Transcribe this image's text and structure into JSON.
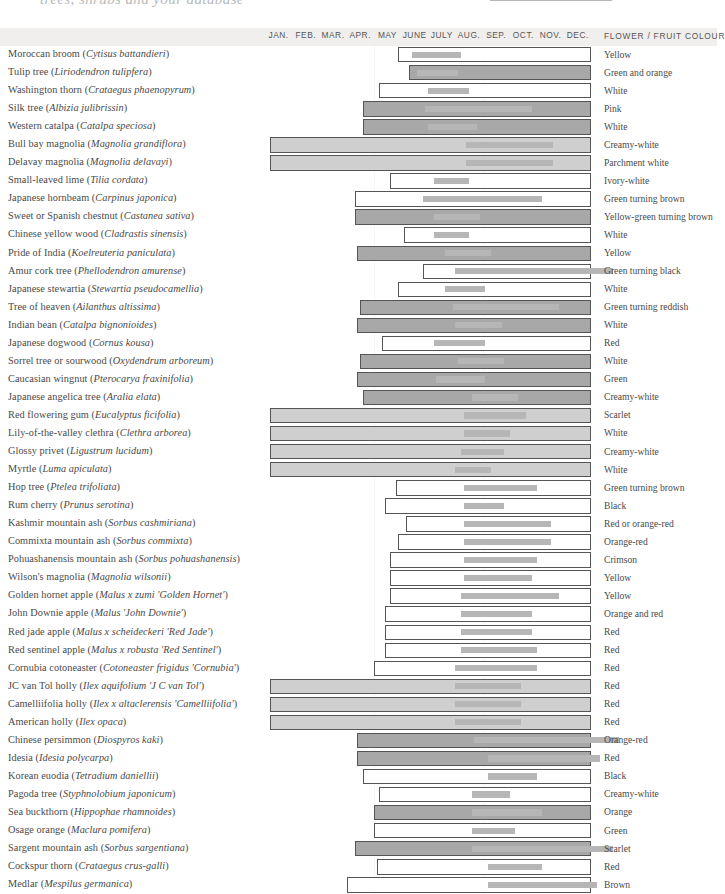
{
  "page": {
    "top_caption": "trees, shrubs and your database",
    "column_header_colour": "FLOWER / FRUIT COLOUR"
  },
  "legend": {
    "swatch_name": "flowering-time-swatch",
    "label": "FLOWERING TIME"
  },
  "chart_data": {
    "type": "bar",
    "xlabel": "",
    "ylabel": "",
    "grid": false,
    "legend_position": "top-right",
    "months": [
      "JAN.",
      "FEB.",
      "MAR.",
      "APR.",
      "MAY",
      "JUNE",
      "JULY",
      "AUG.",
      "SEP.",
      "OCT.",
      "NOV.",
      "DEC."
    ],
    "x_axis_note": "Each row spans a 12-month calendar; outlined bar = fruiting / persistence period, solid grey inner bar = flowering time.",
    "series_names": [
      "fruiting period",
      "flowering time"
    ],
    "rows": [
      {
        "common": "Moroccan broom",
        "latin": "Cytisus battandieri",
        "colour": "Yellow",
        "fruit": {
          "start": 4.9,
          "end": 12.0,
          "style": "outline"
        },
        "flower": {
          "start": 5.4,
          "end": 7.2
        }
      },
      {
        "common": "Tulip tree",
        "latin": "Liriodendron tulipfera",
        "colour": "Green and orange",
        "fruit": {
          "start": 5.3,
          "end": 12.0,
          "style": "mid"
        },
        "flower": {
          "start": 5.6,
          "end": 7.1
        }
      },
      {
        "common": "Washington thorn",
        "latin": "Crataegus phaenopyrum",
        "colour": "White",
        "fruit": {
          "start": 4.2,
          "end": 12.0,
          "style": "outline"
        },
        "flower": {
          "start": 6.0,
          "end": 7.5
        }
      },
      {
        "common": "Silk tree",
        "latin": "Albizia julibrissin",
        "colour": "Pink",
        "fruit": {
          "start": 3.6,
          "end": 12.0,
          "style": "mid"
        },
        "flower": {
          "start": 5.9,
          "end": 9.8
        }
      },
      {
        "common": "Western catalpa",
        "latin": "Catalpa speciosa",
        "colour": "White",
        "fruit": {
          "start": 3.6,
          "end": 12.0,
          "style": "mid"
        },
        "flower": {
          "start": 6.0,
          "end": 7.8
        }
      },
      {
        "common": "Bull bay magnolia",
        "latin": "Magnolia grandiflora",
        "colour": "Creamy-white",
        "fruit": {
          "start": 0.2,
          "end": 12.0,
          "style": "filled"
        },
        "flower": {
          "start": 7.4,
          "end": 10.6
        }
      },
      {
        "common": "Delavay magnolia",
        "latin": "Magnolia delavayi",
        "colour": "Parchment white",
        "fruit": {
          "start": 0.2,
          "end": 12.0,
          "style": "filled"
        },
        "flower": {
          "start": 7.4,
          "end": 10.6
        }
      },
      {
        "common": "Small-leaved lime",
        "latin": "Tilia cordata",
        "colour": "Ivory-white",
        "fruit": {
          "start": 4.6,
          "end": 12.0,
          "style": "outline"
        },
        "flower": {
          "start": 6.2,
          "end": 7.5
        }
      },
      {
        "common": "Japanese hornbeam",
        "latin": "Carpinus japonica",
        "colour": "Green turning brown",
        "fruit": {
          "start": 3.3,
          "end": 12.0,
          "style": "outline"
        },
        "flower": {
          "start": 5.8,
          "end": 10.2
        }
      },
      {
        "common": "Sweet or Spanish chestnut",
        "latin": "Castanea sativa",
        "colour": "Yellow-green turning brown",
        "fruit": {
          "start": 3.3,
          "end": 12.0,
          "style": "mid"
        },
        "flower": {
          "start": 6.2,
          "end": 7.9
        }
      },
      {
        "common": "Chinese yellow wood",
        "latin": "Cladrastis sinensis",
        "colour": "White",
        "fruit": {
          "start": 5.1,
          "end": 12.0,
          "style": "outline"
        },
        "flower": {
          "start": 6.2,
          "end": 7.5
        }
      },
      {
        "common": "Pride of India",
        "latin": "Koelreuteria paniculata",
        "colour": "Yellow",
        "fruit": {
          "start": 3.4,
          "end": 12.0,
          "style": "mid"
        },
        "flower": {
          "start": 6.6,
          "end": 8.3
        }
      },
      {
        "common": "Amur cork tree",
        "latin": "Phellodendron amurense",
        "colour": "Green turning black",
        "fruit": {
          "start": 5.8,
          "end": 12.0,
          "style": "outline"
        },
        "flower": {
          "start": 7.0,
          "end": 12.8
        }
      },
      {
        "common": "Japanese stewartia",
        "latin": "Stewartia pseudocamellia",
        "colour": "White",
        "fruit": {
          "start": 4.9,
          "end": 12.0,
          "style": "outline"
        },
        "flower": {
          "start": 6.6,
          "end": 8.1
        }
      },
      {
        "common": "Tree of heaven",
        "latin": "Ailanthus altissima",
        "colour": "Green turning reddish",
        "fruit": {
          "start": 3.5,
          "end": 12.0,
          "style": "mid"
        },
        "flower": {
          "start": 6.9,
          "end": 10.8
        }
      },
      {
        "common": "Indian bean",
        "latin": "Catalpa bignonioides",
        "colour": "White",
        "fruit": {
          "start": 3.4,
          "end": 12.0,
          "style": "mid"
        },
        "flower": {
          "start": 7.0,
          "end": 8.7
        }
      },
      {
        "common": "Japanese dogwood",
        "latin": "Cornus kousa",
        "colour": "Red",
        "fruit": {
          "start": 4.3,
          "end": 12.0,
          "style": "outline"
        },
        "flower": {
          "start": 6.2,
          "end": 8.1
        }
      },
      {
        "common": "Sorrel tree or sourwood",
        "latin": "Oxydendrum arboreum",
        "colour": "White",
        "fruit": {
          "start": 3.5,
          "end": 12.0,
          "style": "mid"
        },
        "flower": {
          "start": 7.1,
          "end": 8.8
        }
      },
      {
        "common": "Caucasian wingnut",
        "latin": "Pterocarya fraxinifolia",
        "colour": "Green",
        "fruit": {
          "start": 3.4,
          "end": 12.0,
          "style": "mid"
        },
        "flower": {
          "start": 6.3,
          "end": 8.1
        }
      },
      {
        "common": "Japanese angelica tree",
        "latin": "Aralia elata",
        "colour": "Creamy-white",
        "fruit": {
          "start": 3.6,
          "end": 12.0,
          "style": "mid"
        },
        "flower": {
          "start": 7.6,
          "end": 9.3
        }
      },
      {
        "common": "Red flowering gum",
        "latin": "Eucalyptus ficifolia",
        "colour": "Scarlet",
        "fruit": {
          "start": 0.2,
          "end": 12.0,
          "style": "filled"
        },
        "flower": {
          "start": 7.3,
          "end": 9.6
        }
      },
      {
        "common": "Lily-of-the-valley clethra",
        "latin": "Clethra arborea",
        "colour": "White",
        "fruit": {
          "start": 0.2,
          "end": 12.0,
          "style": "filled"
        },
        "flower": {
          "start": 7.3,
          "end": 9.0
        }
      },
      {
        "common": "Glossy privet",
        "latin": "Ligustrum lucidum",
        "colour": "Creamy-white",
        "fruit": {
          "start": 0.2,
          "end": 12.0,
          "style": "filled"
        },
        "flower": {
          "start": 7.2,
          "end": 8.8
        }
      },
      {
        "common": "Myrtle",
        "latin": "Luma apiculata",
        "colour": "White",
        "fruit": {
          "start": 0.2,
          "end": 12.0,
          "style": "filled"
        },
        "flower": {
          "start": 7.0,
          "end": 8.3
        }
      },
      {
        "common": "Hop tree",
        "latin": "Ptelea trifoliata",
        "colour": "Green turning brown",
        "fruit": {
          "start": 4.8,
          "end": 12.0,
          "style": "outline"
        },
        "flower": {
          "start": 7.3,
          "end": 10.0
        }
      },
      {
        "common": "Rum cherry",
        "latin": "Prunus serotina",
        "colour": "Black",
        "fruit": {
          "start": 4.4,
          "end": 12.0,
          "style": "outline"
        },
        "flower": {
          "start": 7.3,
          "end": 8.8
        }
      },
      {
        "common": "Kashmir mountain ash",
        "latin": "Sorbus cashmiriana",
        "colour": "Red or orange-red",
        "fruit": {
          "start": 5.2,
          "end": 12.0,
          "style": "outline"
        },
        "flower": {
          "start": 7.3,
          "end": 10.5
        }
      },
      {
        "common": "Commixta mountain ash",
        "latin": "Sorbus commixta",
        "colour": "Orange-red",
        "fruit": {
          "start": 4.9,
          "end": 12.0,
          "style": "outline"
        },
        "flower": {
          "start": 7.3,
          "end": 10.5
        }
      },
      {
        "common": "Pohuashanensis mountain ash",
        "latin": "Sorbus pohuashanensis",
        "colour": "Crimson",
        "fruit": {
          "start": 4.6,
          "end": 12.0,
          "style": "outline"
        },
        "flower": {
          "start": 7.3,
          "end": 10.0
        }
      },
      {
        "common": "Wilson's magnolia",
        "latin": "Magnolia wilsonii",
        "colour": "Yellow",
        "fruit": {
          "start": 4.6,
          "end": 12.0,
          "style": "outline"
        },
        "flower": {
          "start": 7.3,
          "end": 9.8
        }
      },
      {
        "common": "Golden hornet apple",
        "latin": "Malus x zumi 'Golden Hornet'",
        "colour": "Yellow",
        "fruit": {
          "start": 4.6,
          "end": 12.0,
          "style": "outline"
        },
        "flower": {
          "start": 7.2,
          "end": 10.8
        }
      },
      {
        "common": "John Downie apple",
        "latin": "Malus 'John Downie'",
        "colour": "Orange and red",
        "fruit": {
          "start": 4.4,
          "end": 12.0,
          "style": "outline"
        },
        "flower": {
          "start": 7.2,
          "end": 9.8
        }
      },
      {
        "common": "Red jade apple",
        "latin": "Malus x scheideckeri 'Red Jade'",
        "colour": "Red",
        "fruit": {
          "start": 4.4,
          "end": 12.0,
          "style": "outline"
        },
        "flower": {
          "start": 7.2,
          "end": 9.8
        }
      },
      {
        "common": "Red sentinel apple",
        "latin": "Malus x robusta 'Red Sentinel'",
        "colour": "Red",
        "fruit": {
          "start": 4.4,
          "end": 12.0,
          "style": "outline"
        },
        "flower": {
          "start": 7.2,
          "end": 10.0
        }
      },
      {
        "common": "Cornubia cotoneaster",
        "latin": "Cotoneaster frigidus 'Cornubia'",
        "colour": "Red",
        "fruit": {
          "start": 4.0,
          "end": 12.0,
          "style": "outline"
        },
        "flower": {
          "start": 7.0,
          "end": 10.0
        }
      },
      {
        "common": "JC van Tol holly",
        "latin": "Ilex aquifolium 'J C van Tol'",
        "colour": "Red",
        "fruit": {
          "start": 0.2,
          "end": 12.0,
          "style": "filled"
        },
        "flower": {
          "start": 7.0,
          "end": 9.4
        }
      },
      {
        "common": "Camelliifolia holly",
        "latin": "Ilex x altaclerensis 'Camelliifolia'",
        "colour": "Red",
        "fruit": {
          "start": 0.2,
          "end": 12.0,
          "style": "filled"
        },
        "flower": {
          "start": 7.0,
          "end": 9.4
        }
      },
      {
        "common": "American holly",
        "latin": "Ilex opaca",
        "colour": "Red",
        "fruit": {
          "start": 0.2,
          "end": 12.0,
          "style": "filled"
        },
        "flower": {
          "start": 7.0,
          "end": 9.4
        }
      },
      {
        "common": "Chinese persimmon",
        "latin": "Diospyros kaki",
        "colour": "Orange-red",
        "fruit": {
          "start": 3.4,
          "end": 12.0,
          "style": "mid"
        },
        "flower": {
          "start": 7.7,
          "end": 13.0
        }
      },
      {
        "common": "Idesia",
        "latin": "Idesia polycarpa",
        "colour": "Red",
        "fruit": {
          "start": 3.4,
          "end": 12.0,
          "style": "mid"
        },
        "flower": {
          "start": 8.2,
          "end": 12.3
        }
      },
      {
        "common": "Korean euodia",
        "latin": "Tetradium daniellii",
        "colour": "Black",
        "fruit": {
          "start": 3.6,
          "end": 12.0,
          "style": "outline"
        },
        "flower": {
          "start": 8.2,
          "end": 10.0
        }
      },
      {
        "common": "Pagoda tree",
        "latin": "Styphnolobium japonicum",
        "colour": "Creamy-white",
        "fruit": {
          "start": 4.2,
          "end": 12.0,
          "style": "outline"
        },
        "flower": {
          "start": 7.6,
          "end": 9.0
        }
      },
      {
        "common": "Sea buckthorn",
        "latin": "Hippophae rhamnoides",
        "colour": "Orange",
        "fruit": {
          "start": 4.0,
          "end": 12.0,
          "style": "mid"
        },
        "flower": {
          "start": 7.6,
          "end": 10.2
        }
      },
      {
        "common": "Osage orange",
        "latin": "Maclura pomifera",
        "colour": "Green",
        "fruit": {
          "start": 4.0,
          "end": 12.0,
          "style": "outline"
        },
        "flower": {
          "start": 7.6,
          "end": 9.2
        }
      },
      {
        "common": "Sargent mountain ash",
        "latin": "Sorbus sargentiana",
        "colour": "Scarlet",
        "fruit": {
          "start": 3.3,
          "end": 12.0,
          "style": "mid"
        },
        "flower": {
          "start": 7.6,
          "end": 12.8
        }
      },
      {
        "common": "Cockspur thorn",
        "latin": "Crataegus crus-galli",
        "colour": "Red",
        "fruit": {
          "start": 4.1,
          "end": 12.0,
          "style": "outline"
        },
        "flower": {
          "start": 8.2,
          "end": 10.2
        }
      },
      {
        "common": "Medlar",
        "latin": "Mespilus germanica",
        "colour": "Brown",
        "fruit": {
          "start": 3.0,
          "end": 12.0,
          "style": "outline"
        },
        "flower": {
          "start": 8.2,
          "end": 12.2
        }
      }
    ]
  }
}
